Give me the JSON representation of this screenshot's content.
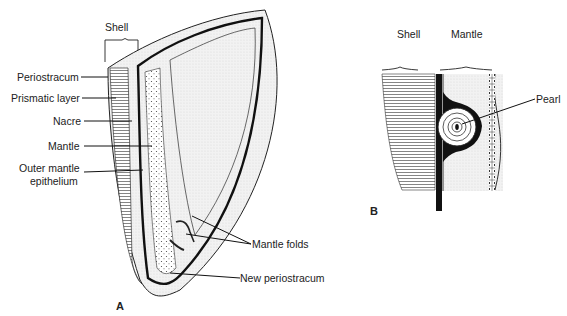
{
  "figure": {
    "panel_a": {
      "letter": "A",
      "bracket_label": "Shell",
      "labels": {
        "periostracum": "Periostracum",
        "prismatic": "Prismatic layer",
        "nacre": "Nacre",
        "mantle": "Mantle",
        "outer_mantle_1": "Outer mantle",
        "outer_mantle_2": "epithelium",
        "mantle_folds": "Mantle folds",
        "new_periostracum": "New periostracum"
      }
    },
    "panel_b": {
      "letter": "B",
      "shell_label": "Shell",
      "mantle_label": "Mantle",
      "pearl_label": "Pearl"
    },
    "colors": {
      "ink": "#1a1a1a",
      "stipple": "#e6e6e6",
      "paper": "#ffffff"
    }
  }
}
